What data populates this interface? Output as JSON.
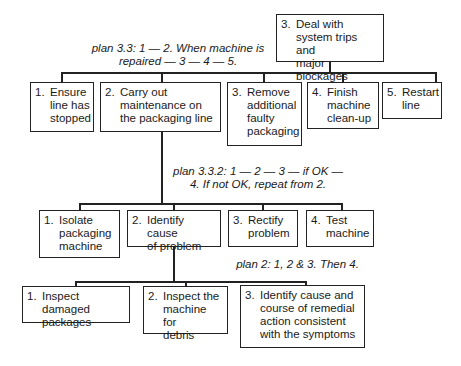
{
  "root": {
    "num": "3.",
    "text": "Deal with\nsystem trips and\nmajor blockages"
  },
  "plans": {
    "plan_3_3": "plan 3.3: 1 — 2. When machine is\nrepaired — 3 — 4 — 5.",
    "plan_3_3_2": "plan 3.3.2: 1 — 2 — 3 — if OK —\n4. If not OK, repeat from 2.",
    "plan_2": "plan 2: 1, 2 & 3. Then 4."
  },
  "level1": [
    {
      "num": "1.",
      "text": "Ensure\nline has\nstopped"
    },
    {
      "num": "2.",
      "text": "Carry out\nmaintenance on\nthe packaging line"
    },
    {
      "num": "3.",
      "text": "Remove\nadditional\nfaulty\npackaging"
    },
    {
      "num": "4.",
      "text": "Finish\nmachine\nclean-up"
    },
    {
      "num": "5.",
      "text": "Restart\nline"
    }
  ],
  "level2": [
    {
      "num": "1.",
      "text": "Isolate\npackaging\nmachine"
    },
    {
      "num": "2.",
      "text": "Identify cause\nof problem"
    },
    {
      "num": "3.",
      "text": "Rectify\nproblem"
    },
    {
      "num": "4.",
      "text": "Test\nmachine"
    }
  ],
  "level3": [
    {
      "num": "1.",
      "text": "Inspect damaged\npackages"
    },
    {
      "num": "2.",
      "text": "Inspect the\nmachine for\ndebris"
    },
    {
      "num": "3.",
      "text": "Identify cause and\ncourse of remedial\naction consistent\nwith the symptoms"
    }
  ]
}
